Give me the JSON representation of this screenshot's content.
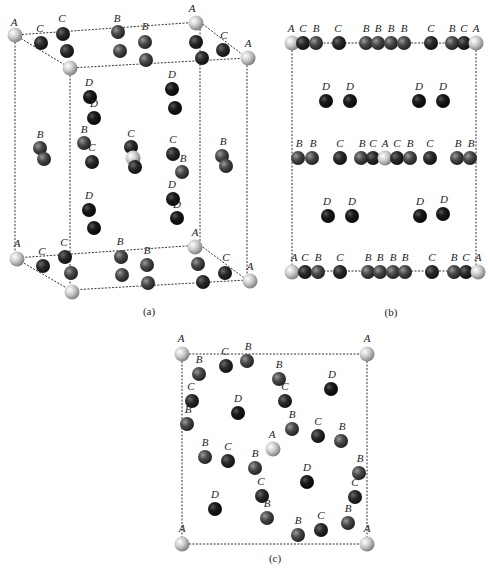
{
  "colors": {
    "A": "#c8c8c8",
    "B": "#4a4a4a",
    "C": "#2a2a2a",
    "D": "#1a1a1a",
    "line": "#333333",
    "background": "#ffffff"
  },
  "captions": {
    "a": "(a)",
    "b": "(b)",
    "c": "(c)"
  },
  "panel_a": {
    "edges": [
      [
        15,
        35,
        70,
        68
      ],
      [
        70,
        68,
        247,
        58
      ],
      [
        15,
        35,
        200,
        22
      ],
      [
        200,
        22,
        247,
        58
      ],
      [
        15,
        35,
        15,
        258
      ],
      [
        70,
        68,
        70,
        290
      ],
      [
        200,
        22,
        200,
        245
      ],
      [
        247,
        58,
        247,
        280
      ],
      [
        15,
        258,
        70,
        290
      ],
      [
        70,
        290,
        247,
        280
      ],
      [
        15,
        258,
        200,
        245
      ],
      [
        200,
        245,
        247,
        280
      ]
    ],
    "atoms": [
      {
        "t": "A",
        "x": 15,
        "y": 35,
        "l": "A",
        "lx": 14,
        "ly": 26
      },
      {
        "t": "C",
        "x": 41,
        "y": 43,
        "l": "C",
        "lx": 40,
        "ly": 32
      },
      {
        "t": "C",
        "x": 63,
        "y": 34,
        "l": "C",
        "lx": 62,
        "ly": 22
      },
      {
        "t": "C",
        "x": 67,
        "y": 51,
        "l": "",
        "lx": 0,
        "ly": 0
      },
      {
        "t": "A",
        "x": 70,
        "y": 68,
        "l": "",
        "lx": 0,
        "ly": 0
      },
      {
        "t": "B",
        "x": 118,
        "y": 32,
        "l": "B",
        "lx": 117,
        "ly": 22
      },
      {
        "t": "B",
        "x": 120,
        "y": 51,
        "l": "",
        "lx": 0,
        "ly": 0
      },
      {
        "t": "B",
        "x": 145,
        "y": 42,
        "l": "B",
        "lx": 145,
        "ly": 30
      },
      {
        "t": "B",
        "x": 146,
        "y": 60,
        "l": "",
        "lx": 0,
        "ly": 0
      },
      {
        "t": "A",
        "x": 196,
        "y": 23,
        "l": "A",
        "lx": 192,
        "ly": 12
      },
      {
        "t": "C",
        "x": 196,
        "y": 42,
        "l": "",
        "lx": 0,
        "ly": 0
      },
      {
        "t": "C",
        "x": 223,
        "y": 50,
        "l": "C",
        "lx": 224,
        "ly": 39
      },
      {
        "t": "C",
        "x": 202,
        "y": 58,
        "l": "",
        "lx": 0,
        "ly": 0
      },
      {
        "t": "A",
        "x": 248,
        "y": 58,
        "l": "A",
        "lx": 248,
        "ly": 47
      },
      {
        "t": "D",
        "x": 90,
        "y": 97,
        "l": "D",
        "lx": 89,
        "ly": 86
      },
      {
        "t": "D",
        "x": 94,
        "y": 118,
        "l": "D",
        "lx": 94,
        "ly": 107
      },
      {
        "t": "D",
        "x": 172,
        "y": 89,
        "l": "D",
        "lx": 172,
        "ly": 78
      },
      {
        "t": "D",
        "x": 175,
        "y": 108,
        "l": "",
        "lx": 0,
        "ly": 0
      },
      {
        "t": "B",
        "x": 40,
        "y": 148,
        "l": "B",
        "lx": 40,
        "ly": 138
      },
      {
        "t": "B",
        "x": 44,
        "y": 159,
        "l": "",
        "lx": 0,
        "ly": 0
      },
      {
        "t": "B",
        "x": 84,
        "y": 143,
        "l": "B",
        "lx": 84,
        "ly": 133
      },
      {
        "t": "C",
        "x": 92,
        "y": 162,
        "l": "C",
        "lx": 92,
        "ly": 151
      },
      {
        "t": "C",
        "x": 131,
        "y": 147,
        "l": "C",
        "lx": 131,
        "ly": 137
      },
      {
        "t": "A",
        "x": 133,
        "y": 158,
        "l": "",
        "lx": 0,
        "ly": 0
      },
      {
        "t": "C",
        "x": 135,
        "y": 167,
        "l": "",
        "lx": 0,
        "ly": 0
      },
      {
        "t": "C",
        "x": 173,
        "y": 154,
        "l": "C",
        "lx": 173,
        "ly": 143
      },
      {
        "t": "B",
        "x": 182,
        "y": 172,
        "l": "B",
        "lx": 183,
        "ly": 162
      },
      {
        "t": "B",
        "x": 222,
        "y": 156,
        "l": "B",
        "lx": 223,
        "ly": 145
      },
      {
        "t": "B",
        "x": 226,
        "y": 166,
        "l": "",
        "lx": 0,
        "ly": 0
      },
      {
        "t": "D",
        "x": 89,
        "y": 210,
        "l": "D",
        "lx": 89,
        "ly": 199
      },
      {
        "t": "D",
        "x": 94,
        "y": 228,
        "l": "",
        "lx": 0,
        "ly": 0
      },
      {
        "t": "D",
        "x": 173,
        "y": 199,
        "l": "D",
        "lx": 172,
        "ly": 188
      },
      {
        "t": "D",
        "x": 177,
        "y": 218,
        "l": "D",
        "lx": 177,
        "ly": 208
      },
      {
        "t": "A",
        "x": 17,
        "y": 259,
        "l": "A",
        "lx": 17,
        "ly": 247
      },
      {
        "t": "C",
        "x": 43,
        "y": 266,
        "l": "C",
        "lx": 42,
        "ly": 255
      },
      {
        "t": "C",
        "x": 65,
        "y": 257,
        "l": "C",
        "lx": 64,
        "ly": 246
      },
      {
        "t": "B",
        "x": 71,
        "y": 273,
        "l": "",
        "lx": 0,
        "ly": 0
      },
      {
        "t": "A",
        "x": 72,
        "y": 292,
        "l": "",
        "lx": 0,
        "ly": 0
      },
      {
        "t": "B",
        "x": 121,
        "y": 257,
        "l": "B",
        "lx": 120,
        "ly": 245
      },
      {
        "t": "B",
        "x": 122,
        "y": 275,
        "l": "",
        "lx": 0,
        "ly": 0
      },
      {
        "t": "B",
        "x": 147,
        "y": 265,
        "l": "B",
        "lx": 147,
        "ly": 254
      },
      {
        "t": "B",
        "x": 148,
        "y": 283,
        "l": "",
        "lx": 0,
        "ly": 0
      },
      {
        "t": "A",
        "x": 195,
        "y": 247,
        "l": "A",
        "lx": 195,
        "ly": 236
      },
      {
        "t": "B",
        "x": 198,
        "y": 264,
        "l": "",
        "lx": 0,
        "ly": 0
      },
      {
        "t": "C",
        "x": 225,
        "y": 273,
        "l": "C",
        "lx": 226,
        "ly": 261
      },
      {
        "t": "C",
        "x": 203,
        "y": 282,
        "l": "",
        "lx": 0,
        "ly": 0
      },
      {
        "t": "A",
        "x": 250,
        "y": 281,
        "l": "A",
        "lx": 250,
        "ly": 270
      }
    ],
    "caption_x": 149,
    "caption_y": 315
  },
  "panel_b": {
    "edges": [
      [
        292,
        43,
        476,
        43
      ],
      [
        292,
        43,
        292,
        271
      ],
      [
        476,
        43,
        476,
        271
      ],
      [
        292,
        271,
        476,
        271
      ]
    ],
    "atoms": [
      {
        "t": "A",
        "x": 292,
        "y": 43,
        "l": "A",
        "lx": 291,
        "ly": 32
      },
      {
        "t": "C",
        "x": 303,
        "y": 43,
        "l": "C",
        "lx": 303,
        "ly": 32
      },
      {
        "t": "B",
        "x": 316,
        "y": 43,
        "l": "B",
        "lx": 316,
        "ly": 32
      },
      {
        "t": "C",
        "x": 339,
        "y": 43,
        "l": "C",
        "lx": 338,
        "ly": 32
      },
      {
        "t": "B",
        "x": 366,
        "y": 43,
        "l": "B",
        "lx": 366,
        "ly": 32
      },
      {
        "t": "B",
        "x": 378,
        "y": 43,
        "l": "B",
        "lx": 378,
        "ly": 32
      },
      {
        "t": "B",
        "x": 391,
        "y": 43,
        "l": "B",
        "lx": 391,
        "ly": 32
      },
      {
        "t": "B",
        "x": 404,
        "y": 43,
        "l": "B",
        "lx": 404,
        "ly": 32
      },
      {
        "t": "C",
        "x": 431,
        "y": 43,
        "l": "C",
        "lx": 431,
        "ly": 32
      },
      {
        "t": "B",
        "x": 452,
        "y": 43,
        "l": "B",
        "lx": 452,
        "ly": 32
      },
      {
        "t": "C",
        "x": 464,
        "y": 43,
        "l": "C",
        "lx": 464,
        "ly": 32
      },
      {
        "t": "A",
        "x": 476,
        "y": 43,
        "l": "A",
        "lx": 476,
        "ly": 32
      },
      {
        "t": "D",
        "x": 326,
        "y": 101,
        "l": "D",
        "lx": 326,
        "ly": 90
      },
      {
        "t": "D",
        "x": 350,
        "y": 101,
        "l": "D",
        "lx": 350,
        "ly": 90
      },
      {
        "t": "D",
        "x": 419,
        "y": 101,
        "l": "D",
        "lx": 419,
        "ly": 90
      },
      {
        "t": "D",
        "x": 443,
        "y": 101,
        "l": "D",
        "lx": 443,
        "ly": 90
      },
      {
        "t": "B",
        "x": 298,
        "y": 158,
        "l": "B",
        "lx": 299,
        "ly": 147
      },
      {
        "t": "B",
        "x": 312,
        "y": 158,
        "l": "B",
        "lx": 313,
        "ly": 147
      },
      {
        "t": "C",
        "x": 340,
        "y": 158,
        "l": "C",
        "lx": 340,
        "ly": 147
      },
      {
        "t": "B",
        "x": 361,
        "y": 158,
        "l": "B",
        "lx": 362,
        "ly": 147
      },
      {
        "t": "C",
        "x": 373,
        "y": 158,
        "l": "C",
        "lx": 373,
        "ly": 147
      },
      {
        "t": "A",
        "x": 385,
        "y": 158,
        "l": "A",
        "lx": 385,
        "ly": 147
      },
      {
        "t": "C",
        "x": 397,
        "y": 158,
        "l": "C",
        "lx": 397,
        "ly": 147
      },
      {
        "t": "B",
        "x": 410,
        "y": 158,
        "l": "B",
        "lx": 410,
        "ly": 147
      },
      {
        "t": "C",
        "x": 430,
        "y": 158,
        "l": "C",
        "lx": 430,
        "ly": 147
      },
      {
        "t": "B",
        "x": 457,
        "y": 158,
        "l": "B",
        "lx": 458,
        "ly": 147
      },
      {
        "t": "B",
        "x": 470,
        "y": 158,
        "l": "B",
        "lx": 471,
        "ly": 147
      },
      {
        "t": "D",
        "x": 328,
        "y": 216,
        "l": "D",
        "lx": 327,
        "ly": 205
      },
      {
        "t": "D",
        "x": 352,
        "y": 216,
        "l": "D",
        "lx": 352,
        "ly": 205
      },
      {
        "t": "D",
        "x": 420,
        "y": 216,
        "l": "D",
        "lx": 420,
        "ly": 205
      },
      {
        "t": "D",
        "x": 443,
        "y": 214,
        "l": "D",
        "lx": 444,
        "ly": 203
      },
      {
        "t": "A",
        "x": 292,
        "y": 272,
        "l": "A",
        "lx": 294,
        "ly": 261
      },
      {
        "t": "C",
        "x": 305,
        "y": 272,
        "l": "C",
        "lx": 305,
        "ly": 261
      },
      {
        "t": "B",
        "x": 318,
        "y": 272,
        "l": "B",
        "lx": 318,
        "ly": 261
      },
      {
        "t": "C",
        "x": 340,
        "y": 272,
        "l": "C",
        "lx": 340,
        "ly": 261
      },
      {
        "t": "B",
        "x": 368,
        "y": 272,
        "l": "B",
        "lx": 368,
        "ly": 261
      },
      {
        "t": "B",
        "x": 380,
        "y": 272,
        "l": "B",
        "lx": 380,
        "ly": 261
      },
      {
        "t": "B",
        "x": 393,
        "y": 272,
        "l": "B",
        "lx": 393,
        "ly": 261
      },
      {
        "t": "B",
        "x": 405,
        "y": 272,
        "l": "B",
        "lx": 405,
        "ly": 261
      },
      {
        "t": "C",
        "x": 432,
        "y": 272,
        "l": "C",
        "lx": 432,
        "ly": 261
      },
      {
        "t": "B",
        "x": 454,
        "y": 272,
        "l": "B",
        "lx": 454,
        "ly": 261
      },
      {
        "t": "C",
        "x": 466,
        "y": 272,
        "l": "C",
        "lx": 466,
        "ly": 261
      },
      {
        "t": "A",
        "x": 478,
        "y": 272,
        "l": "A",
        "lx": 478,
        "ly": 261
      }
    ],
    "caption_x": 391,
    "caption_y": 316
  },
  "panel_c": {
    "edges": [
      [
        182,
        354,
        367,
        354
      ],
      [
        182,
        354,
        182,
        544
      ],
      [
        367,
        354,
        367,
        544
      ],
      [
        182,
        544,
        367,
        544
      ]
    ],
    "atoms": [
      {
        "t": "A",
        "x": 182,
        "y": 354,
        "l": "A",
        "lx": 181,
        "ly": 342
      },
      {
        "t": "C",
        "x": 226,
        "y": 366,
        "l": "C",
        "lx": 225,
        "ly": 355
      },
      {
        "t": "B",
        "x": 247,
        "y": 361,
        "l": "B",
        "lx": 248,
        "ly": 350
      },
      {
        "t": "A",
        "x": 367,
        "y": 354,
        "l": "A",
        "lx": 367,
        "ly": 342
      },
      {
        "t": "B",
        "x": 199,
        "y": 374,
        "l": "B",
        "lx": 199,
        "ly": 363
      },
      {
        "t": "B",
        "x": 279,
        "y": 379,
        "l": "B",
        "lx": 279,
        "ly": 368
      },
      {
        "t": "D",
        "x": 331,
        "y": 389,
        "l": "D",
        "lx": 332,
        "ly": 378
      },
      {
        "t": "C",
        "x": 192,
        "y": 401,
        "l": "C",
        "lx": 191,
        "ly": 390
      },
      {
        "t": "D",
        "x": 238,
        "y": 413,
        "l": "D",
        "lx": 238,
        "ly": 402
      },
      {
        "t": "C",
        "x": 285,
        "y": 401,
        "l": "C",
        "lx": 285,
        "ly": 390
      },
      {
        "t": "B",
        "x": 187,
        "y": 424,
        "l": "B",
        "lx": 188,
        "ly": 413
      },
      {
        "t": "B",
        "x": 292,
        "y": 429,
        "l": "B",
        "lx": 292,
        "ly": 418
      },
      {
        "t": "C",
        "x": 318,
        "y": 436,
        "l": "C",
        "lx": 318,
        "ly": 425
      },
      {
        "t": "B",
        "x": 341,
        "y": 441,
        "l": "B",
        "lx": 342,
        "ly": 430
      },
      {
        "t": "A",
        "x": 273,
        "y": 449,
        "l": "A",
        "lx": 272,
        "ly": 438
      },
      {
        "t": "B",
        "x": 205,
        "y": 457,
        "l": "B",
        "lx": 205,
        "ly": 446
      },
      {
        "t": "C",
        "x": 228,
        "y": 461,
        "l": "C",
        "lx": 228,
        "ly": 450
      },
      {
        "t": "B",
        "x": 255,
        "y": 468,
        "l": "B",
        "lx": 255,
        "ly": 457
      },
      {
        "t": "B",
        "x": 359,
        "y": 473,
        "l": "B",
        "lx": 360,
        "ly": 462
      },
      {
        "t": "D",
        "x": 307,
        "y": 482,
        "l": "D",
        "lx": 307,
        "ly": 471
      },
      {
        "t": "C",
        "x": 262,
        "y": 496,
        "l": "C",
        "lx": 261,
        "ly": 485
      },
      {
        "t": "C",
        "x": 355,
        "y": 497,
        "l": "C",
        "lx": 355,
        "ly": 486
      },
      {
        "t": "D",
        "x": 215,
        "y": 509,
        "l": "D",
        "lx": 215,
        "ly": 498
      },
      {
        "t": "B",
        "x": 267,
        "y": 518,
        "l": "B",
        "lx": 267,
        "ly": 507
      },
      {
        "t": "B",
        "x": 348,
        "y": 523,
        "l": "B",
        "lx": 348,
        "ly": 512
      },
      {
        "t": "C",
        "x": 321,
        "y": 530,
        "l": "C",
        "lx": 321,
        "ly": 519
      },
      {
        "t": "B",
        "x": 298,
        "y": 535,
        "l": "B",
        "lx": 298,
        "ly": 524
      },
      {
        "t": "A",
        "x": 182,
        "y": 544,
        "l": "A",
        "lx": 182,
        "ly": 532
      },
      {
        "t": "A",
        "x": 367,
        "y": 544,
        "l": "A",
        "lx": 367,
        "ly": 532
      }
    ],
    "caption_x": 275,
    "caption_y": 562
  }
}
